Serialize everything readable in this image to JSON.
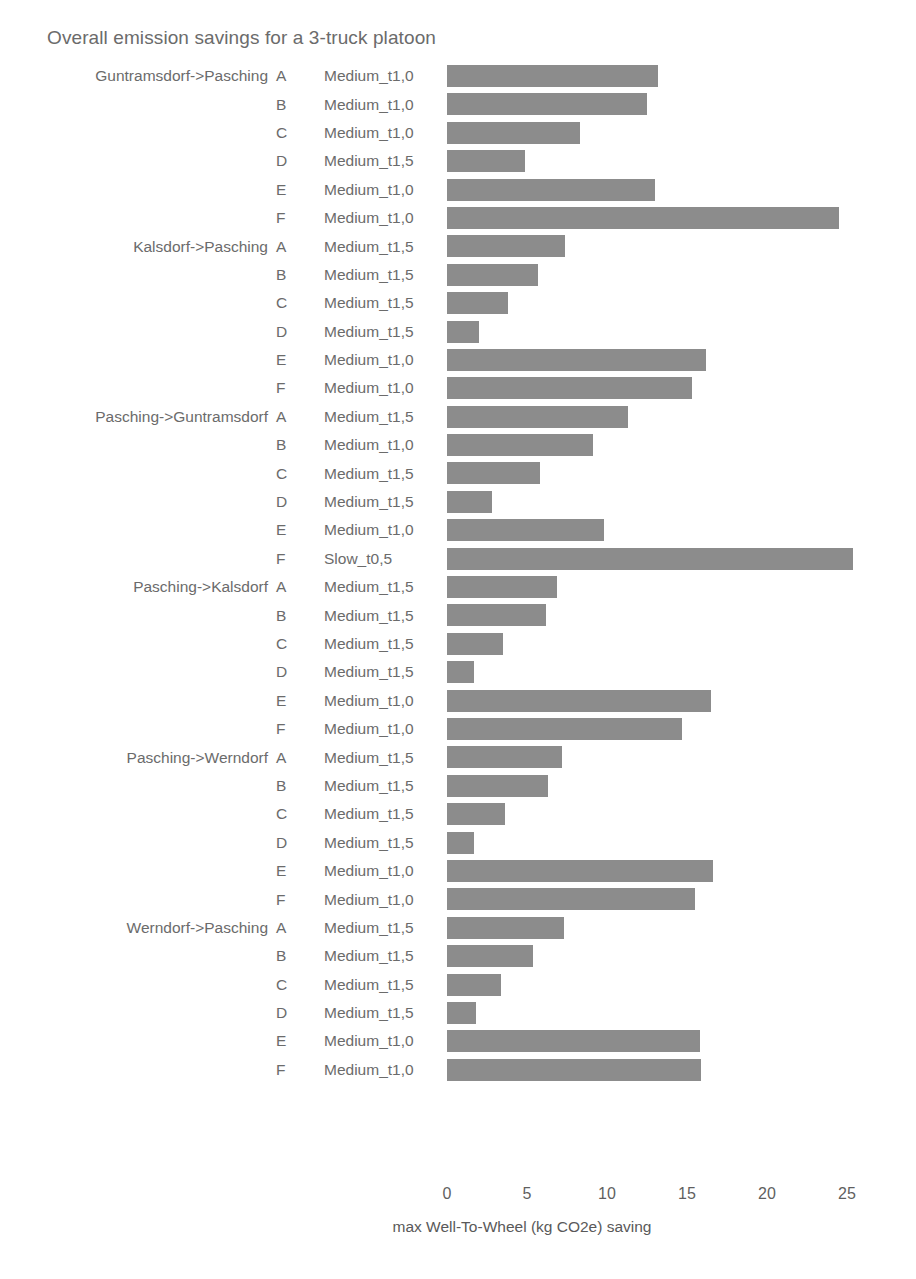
{
  "chart_data": {
    "type": "bar",
    "orientation": "horizontal",
    "title": "Overall emission savings for a 3-truck platoon",
    "xlabel": "max Well-To-Wheel (kg CO2e) saving",
    "ylabel": "",
    "xlim": [
      0,
      27.5
    ],
    "xticks": [
      0,
      5,
      10,
      15,
      20,
      25
    ],
    "xticklabels": [
      "0",
      "5",
      "10",
      "15",
      "20",
      "25"
    ],
    "grid": false,
    "legend": "none",
    "bar_color": "#8c8c8c",
    "groups": [
      {
        "label": "Guntramsdorf->Pasching",
        "rows": [
          {
            "series": "A",
            "mode": "Medium_t1,0",
            "value": 13.2
          },
          {
            "series": "B",
            "mode": "Medium_t1,0",
            "value": 12.5
          },
          {
            "series": "C",
            "mode": "Medium_t1,0",
            "value": 8.3
          },
          {
            "series": "D",
            "mode": "Medium_t1,5",
            "value": 4.9
          },
          {
            "series": "E",
            "mode": "Medium_t1,0",
            "value": 13.0
          },
          {
            "series": "F",
            "mode": "Medium_t1,0",
            "value": 24.5
          }
        ]
      },
      {
        "label": "Kalsdorf->Pasching",
        "rows": [
          {
            "series": "A",
            "mode": "Medium_t1,5",
            "value": 7.4
          },
          {
            "series": "B",
            "mode": "Medium_t1,5",
            "value": 5.7
          },
          {
            "series": "C",
            "mode": "Medium_t1,5",
            "value": 3.8
          },
          {
            "series": "D",
            "mode": "Medium_t1,5",
            "value": 2.0
          },
          {
            "series": "E",
            "mode": "Medium_t1,0",
            "value": 16.2
          },
          {
            "series": "F",
            "mode": "Medium_t1,0",
            "value": 15.3
          }
        ]
      },
      {
        "label": "Pasching->Guntramsdorf",
        "rows": [
          {
            "series": "A",
            "mode": "Medium_t1,5",
            "value": 11.3
          },
          {
            "series": "B",
            "mode": "Medium_t1,0",
            "value": 9.1
          },
          {
            "series": "C",
            "mode": "Medium_t1,5",
            "value": 5.8
          },
          {
            "series": "D",
            "mode": "Medium_t1,5",
            "value": 2.8
          },
          {
            "series": "E",
            "mode": "Medium_t1,0",
            "value": 9.8
          },
          {
            "series": "F",
            "mode": "Slow_t0,5",
            "value": 25.4
          }
        ]
      },
      {
        "label": "Pasching->Kalsdorf",
        "rows": [
          {
            "series": "A",
            "mode": "Medium_t1,5",
            "value": 6.9
          },
          {
            "series": "B",
            "mode": "Medium_t1,5",
            "value": 6.2
          },
          {
            "series": "C",
            "mode": "Medium_t1,5",
            "value": 3.5
          },
          {
            "series": "D",
            "mode": "Medium_t1,5",
            "value": 1.7
          },
          {
            "series": "E",
            "mode": "Medium_t1,0",
            "value": 16.5
          },
          {
            "series": "F",
            "mode": "Medium_t1,0",
            "value": 14.7
          }
        ]
      },
      {
        "label": "Pasching->Werndorf",
        "rows": [
          {
            "series": "A",
            "mode": "Medium_t1,5",
            "value": 7.2
          },
          {
            "series": "B",
            "mode": "Medium_t1,5",
            "value": 6.3
          },
          {
            "series": "C",
            "mode": "Medium_t1,5",
            "value": 3.6
          },
          {
            "series": "D",
            "mode": "Medium_t1,5",
            "value": 1.7
          },
          {
            "series": "E",
            "mode": "Medium_t1,0",
            "value": 16.6
          },
          {
            "series": "F",
            "mode": "Medium_t1,0",
            "value": 15.5
          }
        ]
      },
      {
        "label": "Werndorf->Pasching",
        "rows": [
          {
            "series": "A",
            "mode": "Medium_t1,5",
            "value": 7.3
          },
          {
            "series": "B",
            "mode": "Medium_t1,5",
            "value": 5.4
          },
          {
            "series": "C",
            "mode": "Medium_t1,5",
            "value": 3.4
          },
          {
            "series": "D",
            "mode": "Medium_t1,5",
            "value": 1.8
          },
          {
            "series": "E",
            "mode": "Medium_t1,0",
            "value": 15.8
          },
          {
            "series": "F",
            "mode": "Medium_t1,0",
            "value": 15.9
          }
        ]
      }
    ]
  }
}
